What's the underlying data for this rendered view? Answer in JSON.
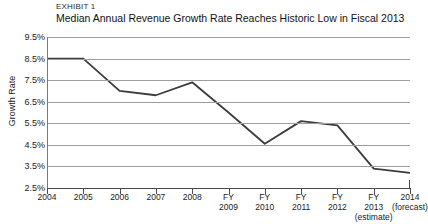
{
  "exhibit": {
    "label": "EXHIBIT 1",
    "title": "Median Annual Revenue Growth Rate Reaches Historic Low in Fiscal 2013"
  },
  "chart_data": {
    "type": "line",
    "title": "Median Annual Revenue Growth Rate Reaches Historic Low in Fiscal 2013",
    "subtitle": "EXHIBIT 1",
    "xlabel": "",
    "ylabel": "Growth Rate",
    "ylim": [
      2.5,
      9.5
    ],
    "ytick_step": 1,
    "ytick_labels": [
      "9.5%",
      "8.5%",
      "7.5%",
      "6.5%",
      "5.5%",
      "4.5%",
      "3.5%",
      "2.5%"
    ],
    "ytick_values": [
      9.5,
      8.5,
      7.5,
      6.5,
      5.5,
      4.5,
      3.5,
      2.5
    ],
    "grid": true,
    "legend": false,
    "categories": [
      "2004",
      "2005",
      "2006",
      "2007",
      "2008",
      "FY 2009",
      "FY 2010",
      "FY 2011",
      "FY 2012",
      "FY 2013 (estimate)",
      "2014 (forecast)"
    ],
    "xtick_labels": [
      {
        "l1": "2004",
        "l2": "",
        "l3": ""
      },
      {
        "l1": "2005",
        "l2": "",
        "l3": ""
      },
      {
        "l1": "2006",
        "l2": "",
        "l3": ""
      },
      {
        "l1": "2007",
        "l2": "",
        "l3": ""
      },
      {
        "l1": "2008",
        "l2": "",
        "l3": ""
      },
      {
        "l1": "FY",
        "l2": "2009",
        "l3": ""
      },
      {
        "l1": "FY",
        "l2": "2010",
        "l3": ""
      },
      {
        "l1": "FY",
        "l2": "2011",
        "l3": ""
      },
      {
        "l1": "FY",
        "l2": "2012",
        "l3": ""
      },
      {
        "l1": "FY",
        "l2": "2013",
        "l3": "(estimate)"
      },
      {
        "l1": "2014",
        "l2": "(forecast)",
        "l3": ""
      }
    ],
    "series": [
      {
        "name": "Median Annual Revenue Growth Rate",
        "values": [
          8.5,
          8.5,
          7.0,
          6.8,
          7.4,
          6.0,
          4.55,
          5.6,
          5.4,
          3.4,
          3.2
        ],
        "color": "#3c3c3c"
      }
    ],
    "colors": {
      "line": "#3c3c3c",
      "gridline": "#9d9d9d",
      "axis": "#4a4a4a",
      "text": "#1b1b1b",
      "background": "#ffffff"
    }
  }
}
